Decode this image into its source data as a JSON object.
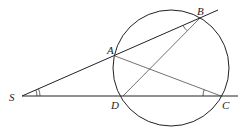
{
  "diagram": {
    "type": "circle-secant-geometry",
    "points": {
      "S": {
        "label": "S",
        "x": 22,
        "y": 96
      },
      "A": {
        "label": "A",
        "x": 115,
        "y": 56
      },
      "B": {
        "label": "B",
        "x": 200,
        "y": 18
      },
      "D": {
        "label": "D",
        "x": 123,
        "y": 96
      },
      "C": {
        "label": "C",
        "x": 221,
        "y": 96
      }
    },
    "circle": {
      "cx": 171,
      "cy": 68,
      "r": 58
    },
    "segments": [
      "S-B (extended)",
      "S-C (extended)",
      "A-C",
      "B-D"
    ],
    "marked_angles": [
      "angle ASD (double arc)",
      "angle ABD (single arc)",
      "angle ACD (single arc)"
    ],
    "stroke_color": "#222222"
  }
}
